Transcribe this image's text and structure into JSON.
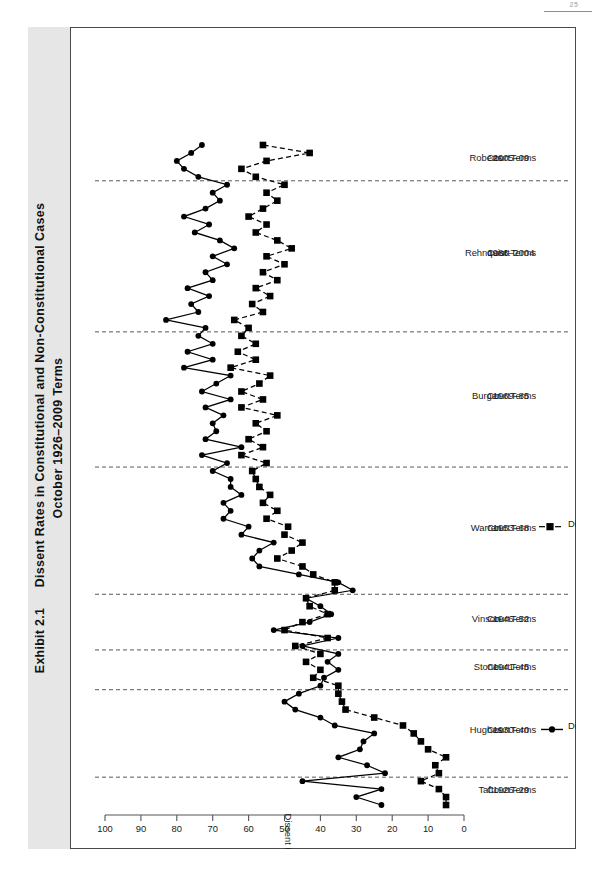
{
  "page": {
    "number": "25"
  },
  "exhibit": {
    "label": "Exhibit 2.1",
    "title_line1": "Dissent Rates in Constitutional and Non-Constitutional Cases",
    "title_line2": "October 1926–2009 Terms"
  },
  "chart_data": {
    "type": "line",
    "orientation": "horizontal-time-axis-vertical",
    "xlabel": "",
    "ylabel": "Dissent Rate (%)",
    "ylim": [
      0,
      100
    ],
    "yticks": [
      100,
      90,
      80,
      70,
      60,
      50,
      40,
      30,
      20,
      10,
      0
    ],
    "grid": false,
    "legend_position": "bottom-right",
    "x": [
      1926,
      1927,
      1928,
      1929,
      1930,
      1931,
      1932,
      1933,
      1934,
      1935,
      1936,
      1937,
      1938,
      1939,
      1940,
      1941,
      1942,
      1943,
      1944,
      1945,
      1946,
      1947,
      1948,
      1949,
      1950,
      1951,
      1952,
      1953,
      1954,
      1955,
      1956,
      1957,
      1958,
      1959,
      1960,
      1961,
      1962,
      1963,
      1964,
      1965,
      1966,
      1967,
      1968,
      1969,
      1970,
      1971,
      1972,
      1973,
      1974,
      1975,
      1976,
      1977,
      1978,
      1979,
      1980,
      1981,
      1982,
      1983,
      1984,
      1985,
      1986,
      1987,
      1988,
      1989,
      1990,
      1991,
      1992,
      1993,
      1994,
      1995,
      1996,
      1997,
      1998,
      1999,
      2000,
      2001,
      2002,
      2003,
      2004,
      2005,
      2006,
      2007,
      2008,
      2009
    ],
    "series": [
      {
        "name": "Dissent Rate in Constitutional Cases",
        "marker": "circle",
        "linestyle": "solid",
        "color": "#000000",
        "values": [
          23,
          30,
          23,
          45,
          22,
          27,
          35,
          29,
          28,
          25,
          36,
          40,
          47,
          50,
          46,
          40,
          39,
          35,
          38,
          35,
          45,
          35,
          53,
          43,
          37,
          40,
          44,
          31,
          35,
          46,
          57,
          59,
          57,
          53,
          62,
          60,
          67,
          65,
          67,
          62,
          65,
          65,
          70,
          66,
          73,
          62,
          72,
          69,
          70,
          67,
          72,
          65,
          73,
          69,
          65,
          78,
          70,
          77,
          70,
          74,
          72,
          83,
          74,
          76,
          71,
          77,
          70,
          72,
          66,
          70,
          64,
          68,
          75,
          71,
          78,
          72,
          68,
          70,
          66,
          74,
          78,
          80,
          76,
          73
        ]
      },
      {
        "name": "Dissent Rate in Non-Constitutional Cases",
        "marker": "square",
        "linestyle": "dashed",
        "color": "#000000",
        "values": [
          5,
          5,
          7,
          12,
          7,
          8,
          5,
          10,
          12,
          14,
          17,
          25,
          33,
          34,
          35,
          35,
          42,
          40,
          44,
          40,
          47,
          38,
          50,
          45,
          38,
          43,
          44,
          36,
          36,
          42,
          45,
          52,
          48,
          45,
          50,
          49,
          55,
          52,
          56,
          54,
          57,
          58,
          59,
          55,
          62,
          56,
          60,
          55,
          58,
          52,
          62,
          56,
          62,
          57,
          54,
          65,
          58,
          63,
          58,
          62,
          60,
          64,
          56,
          59,
          54,
          58,
          52,
          56,
          50,
          55,
          48,
          52,
          58,
          55,
          60,
          56,
          52,
          55,
          50,
          58,
          62,
          55,
          43,
          56
        ]
      }
    ],
    "court_eras": [
      {
        "name": "Taft",
        "court_word": "Court",
        "terms": "1926–29",
        "terms_word": "Terms",
        "start": 1926,
        "end": 1929
      },
      {
        "name": "Hughes",
        "court_word": "Court",
        "terms": "1930–40",
        "terms_word": "Terms",
        "start": 1930,
        "end": 1940
      },
      {
        "name": "Stone",
        "court_word": "Court",
        "terms": "1941–45",
        "terms_word": "Terms",
        "start": 1941,
        "end": 1945
      },
      {
        "name": "Vinson",
        "court_word": "Court",
        "terms": "1946–52",
        "terms_word": "Terms",
        "start": 1946,
        "end": 1952
      },
      {
        "name": "Warren",
        "court_word": "Court",
        "terms": "1953–68",
        "terms_word": "Terms",
        "start": 1953,
        "end": 1968
      },
      {
        "name": "Burger",
        "court_word": "Court",
        "terms": "1969–85",
        "terms_word": "Terms",
        "start": 1969,
        "end": 1985
      },
      {
        "name": "Rehnquist",
        "court_word": "Court",
        "terms": "1986–2004",
        "terms_word": "Terms",
        "start": 1986,
        "end": 2004
      },
      {
        "name": "Roberts",
        "court_word": "Court",
        "terms": "2005–09",
        "terms_word": "Terms",
        "start": 2005,
        "end": 2009
      }
    ]
  }
}
